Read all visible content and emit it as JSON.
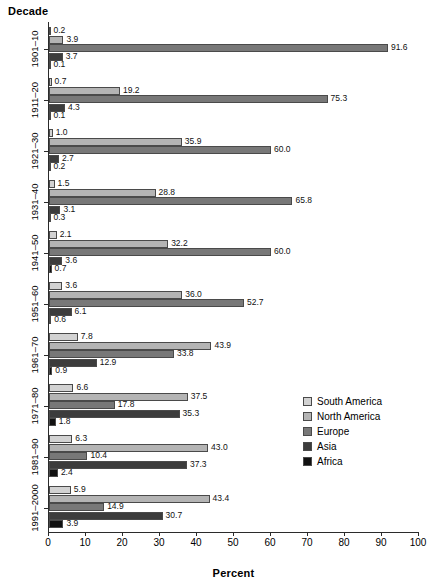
{
  "chart_data": {
    "type": "bar",
    "orientation": "horizontal",
    "title": "",
    "xlabel": "Percent",
    "ylabel": "Decade",
    "xlim": [
      0,
      100
    ],
    "xticks": [
      0,
      10,
      20,
      30,
      40,
      50,
      60,
      70,
      80,
      90,
      100
    ],
    "grid": false,
    "legend_position": "right-middle",
    "categories": [
      "1901–10",
      "1911–20",
      "1921–30",
      "1931–40",
      "1941–50",
      "1951–60",
      "1961–70",
      "1971–80",
      "1981–90",
      "1991–2000"
    ],
    "series": [
      {
        "name": "South America",
        "color": "#d2d2d2",
        "values": [
          0.2,
          0.7,
          1.0,
          1.5,
          2.1,
          3.6,
          7.8,
          6.6,
          6.3,
          5.9
        ]
      },
      {
        "name": "North America",
        "color": "#b4b4b4",
        "values": [
          3.9,
          19.2,
          35.9,
          28.8,
          32.2,
          36.0,
          43.9,
          37.5,
          43.0,
          43.4
        ]
      },
      {
        "name": "Europe",
        "color": "#787878",
        "values": [
          91.6,
          75.3,
          60.0,
          65.8,
          60.0,
          52.7,
          33.8,
          17.8,
          10.4,
          14.9
        ]
      },
      {
        "name": "Asia",
        "color": "#3c3c3c",
        "values": [
          3.7,
          4.3,
          2.7,
          3.1,
          3.6,
          6.1,
          12.9,
          35.3,
          37.3,
          30.7
        ]
      },
      {
        "name": "Africa",
        "color": "#111111",
        "values": [
          0.1,
          0.1,
          0.2,
          0.3,
          0.7,
          0.6,
          0.9,
          1.8,
          2.4,
          3.9
        ]
      }
    ],
    "value_labels": [
      [
        "0.2",
        "3.9",
        "91.6",
        "3.7",
        "0.1"
      ],
      [
        "0.7",
        "19.2",
        "75.3",
        "4.3",
        "0.1"
      ],
      [
        "1.0",
        "35.9",
        "60.0",
        "2.7",
        "0.2"
      ],
      [
        "1.5",
        "28.8",
        "65.8",
        "3.1",
        "0.3"
      ],
      [
        "2.1",
        "32.2",
        "60.0",
        "3.6",
        "0.7"
      ],
      [
        "3.6",
        "36.0",
        "52.7",
        "6.1",
        "0.6"
      ],
      [
        "7.8",
        "43.9",
        "33.8",
        "12.9",
        "0.9"
      ],
      [
        "6.6",
        "37.5",
        "17.8",
        "35.3",
        "1.8"
      ],
      [
        "6.3",
        "43.0",
        "10.4",
        "37.3",
        "2.4"
      ],
      [
        "5.9",
        "43.4",
        "14.9",
        "30.7",
        "3.9"
      ]
    ]
  },
  "axes": {
    "y_title": "Decade",
    "x_title": "Percent"
  },
  "legend": {
    "items": [
      {
        "label": "South America",
        "color": "#d2d2d2"
      },
      {
        "label": "North America",
        "color": "#b4b4b4"
      },
      {
        "label": "Europe",
        "color": "#787878"
      },
      {
        "label": "Asia",
        "color": "#3c3c3c"
      },
      {
        "label": "Africa",
        "color": "#111111"
      }
    ]
  }
}
